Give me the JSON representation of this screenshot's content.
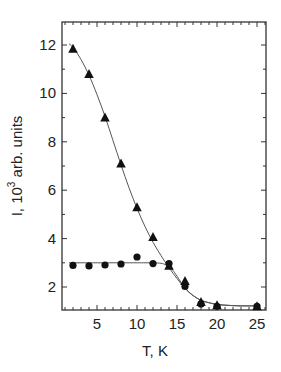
{
  "chart_data": {
    "type": "scatter",
    "title": "",
    "xlabel": "T, K",
    "ylabel": "I, 10 3 arb. units",
    "ylabel_parts": {
      "prefix": "I, 10",
      "superscript": "3",
      "suffix": " arb. units"
    },
    "xlim": [
      0.6,
      26.1
    ],
    "ylim": [
      1.05,
      12.95
    ],
    "xticks": [
      5,
      10,
      15,
      20,
      25
    ],
    "yticks": [
      2,
      4,
      6,
      8,
      10,
      12
    ],
    "x_minor_step": 1,
    "y_minor_step": 1,
    "grid": false,
    "legend": null,
    "series": [
      {
        "name": "triangles",
        "marker": "triangle",
        "x": [
          2,
          4,
          6,
          8,
          10,
          12,
          14,
          16,
          18,
          20,
          25
        ],
        "y": [
          11.85,
          10.8,
          9.0,
          7.1,
          5.3,
          4.07,
          2.88,
          2.25,
          1.38,
          1.25,
          1.2
        ]
      },
      {
        "name": "circles",
        "marker": "circle",
        "x": [
          2,
          4,
          6,
          8,
          10,
          12,
          14,
          16,
          18,
          20,
          25
        ],
        "y": [
          2.89,
          2.87,
          2.91,
          2.95,
          3.24,
          2.97,
          2.97,
          2.02,
          1.3,
          1.2,
          1.2
        ]
      }
    ],
    "fit_curves": [
      {
        "name": "triangles-fit",
        "x": [
          1.5,
          2,
          3,
          4,
          5,
          6,
          7,
          8,
          9,
          10,
          11,
          12,
          13,
          14,
          15,
          16,
          17,
          18,
          19,
          20,
          21,
          22,
          23,
          24,
          25
        ],
        "y": [
          12.05,
          11.9,
          11.4,
          10.75,
          9.95,
          9.05,
          8.05,
          7.05,
          6.1,
          5.25,
          4.5,
          3.85,
          3.3,
          2.8,
          2.35,
          1.95,
          1.65,
          1.45,
          1.35,
          1.28,
          1.25,
          1.23,
          1.22,
          1.22,
          1.22
        ]
      },
      {
        "name": "circles-fit",
        "x": [
          1.5,
          4,
          6,
          8,
          10,
          11,
          12,
          13,
          13.5,
          14,
          14.5,
          15,
          16,
          17,
          18,
          19,
          20,
          21,
          22,
          23,
          24,
          25
        ],
        "y": [
          3.0,
          3.0,
          3.0,
          3.0,
          3.0,
          3.0,
          3.0,
          2.98,
          2.93,
          2.85,
          2.68,
          2.45,
          1.95,
          1.65,
          1.45,
          1.35,
          1.28,
          1.25,
          1.23,
          1.22,
          1.22,
          1.22
        ]
      }
    ],
    "colors": {
      "markers": "#111111",
      "fit_line": "#555555",
      "axes": "#333333"
    }
  }
}
